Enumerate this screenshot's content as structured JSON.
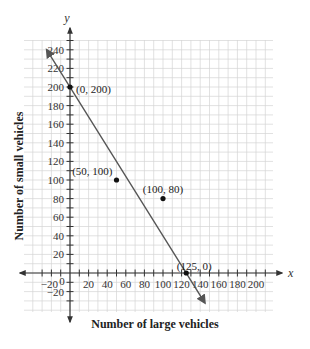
{
  "chart_data": {
    "type": "scatter",
    "title": "",
    "xlabel": "Number of large vehicles",
    "ylabel": "Number of small vehicles",
    "x_axis_var": "x",
    "y_axis_var": "y",
    "xlim": [
      -30,
      215
    ],
    "ylim": [
      -40,
      250
    ],
    "grid": true,
    "grid_step": 10,
    "x_ticks": [
      -20,
      0,
      20,
      40,
      60,
      80,
      100,
      120,
      140,
      160,
      180,
      200
    ],
    "x_tick_labels": [
      "-20",
      "0",
      "20",
      "40",
      "60",
      "80",
      "100",
      "120",
      "140",
      "160",
      "180",
      "200"
    ],
    "y_ticks": [
      -20,
      20,
      40,
      60,
      80,
      100,
      120,
      140,
      160,
      180,
      200,
      220,
      240
    ],
    "y_tick_labels": [
      "-20",
      "20",
      "40",
      "60",
      "80",
      "100",
      "120",
      "140",
      "160",
      "180",
      "200",
      "220",
      "240"
    ],
    "points": [
      {
        "x": 0,
        "y": 200,
        "label": "(0, 200)"
      },
      {
        "x": 50,
        "y": 100,
        "label": "(50, 100)"
      },
      {
        "x": 100,
        "y": 80,
        "label": "(100, 80)"
      },
      {
        "x": 125,
        "y": 0,
        "label": "(125, 0)"
      }
    ],
    "line": {
      "equation": "y = 200 - 1.6x",
      "from": [
        -25,
        240
      ],
      "to": [
        145,
        -32
      ],
      "arrows": "both"
    },
    "legend": null
  }
}
